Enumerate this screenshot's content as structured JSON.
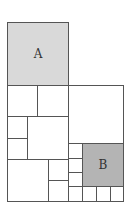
{
  "diagram": {
    "type": "squared-rectangle",
    "stroke_color": "#555555",
    "colors": {
      "A": "#d9d9d9",
      "B": "#b4b4b4",
      "default": "#ffffff"
    },
    "labels": {
      "A": "A",
      "B": "B"
    },
    "shapes": [
      {
        "id": "A",
        "x": 7,
        "y": 22,
        "w": 61,
        "h": 63,
        "fill": "A",
        "label": "A"
      },
      {
        "id": "s1",
        "x": 7,
        "y": 85,
        "w": 30,
        "h": 31
      },
      {
        "id": "s2",
        "x": 37,
        "y": 85,
        "w": 31,
        "h": 31
      },
      {
        "id": "s3",
        "x": 68,
        "y": 85,
        "w": 55,
        "h": 58
      },
      {
        "id": "s4",
        "x": 7,
        "y": 116,
        "w": 20,
        "h": 22
      },
      {
        "id": "s5",
        "x": 7,
        "y": 138,
        "w": 20,
        "h": 21
      },
      {
        "id": "s6",
        "x": 27,
        "y": 116,
        "w": 41,
        "h": 43
      },
      {
        "id": "s7",
        "x": 7,
        "y": 159,
        "w": 41,
        "h": 42
      },
      {
        "id": "s8",
        "x": 48,
        "y": 159,
        "w": 20,
        "h": 21
      },
      {
        "id": "s9",
        "x": 48,
        "y": 180,
        "w": 20,
        "h": 21
      },
      {
        "id": "s10",
        "x": 68,
        "y": 143,
        "w": 14,
        "h": 15
      },
      {
        "id": "s11",
        "x": 68,
        "y": 158,
        "w": 14,
        "h": 14
      },
      {
        "id": "s12",
        "x": 68,
        "y": 172,
        "w": 14,
        "h": 14
      },
      {
        "id": "B",
        "x": 82,
        "y": 143,
        "w": 41,
        "h": 43,
        "fill": "B",
        "label": "B"
      },
      {
        "id": "s13",
        "x": 68,
        "y": 186,
        "w": 14,
        "h": 15
      },
      {
        "id": "s14",
        "x": 82,
        "y": 186,
        "w": 14,
        "h": 15
      },
      {
        "id": "s15",
        "x": 96,
        "y": 186,
        "w": 14,
        "h": 15
      },
      {
        "id": "s16",
        "x": 110,
        "y": 186,
        "w": 13,
        "h": 15
      }
    ]
  }
}
